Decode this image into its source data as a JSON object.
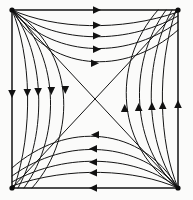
{
  "figure": {
    "type": "vector-field-phase-portrait",
    "background_color": "#fbfbfa",
    "line_color": "#141414",
    "frame_color": "#242424",
    "width": 193,
    "height": 200
  },
  "chart_data": {
    "type": "diagram",
    "subtitle": "",
    "xlabel": "",
    "ylabel": "",
    "grid": false,
    "legend": null,
    "axis_ranges": {
      "x": [
        12,
        178
      ],
      "y": [
        10,
        188
      ]
    },
    "frame": {
      "x0": 12,
      "y0": 10,
      "x1": 178,
      "y1": 188
    },
    "critical_points": [
      {
        "name": "top-left-corner",
        "x": 12,
        "y": 10,
        "kind": "source"
      },
      {
        "name": "top-right-corner",
        "x": 178,
        "y": 10,
        "kind": "sink"
      },
      {
        "name": "bottom-left-corner",
        "x": 12,
        "y": 188,
        "kind": "sink"
      },
      {
        "name": "bottom-right-corner",
        "x": 178,
        "y": 188,
        "kind": "source"
      },
      {
        "name": "center",
        "x": 95,
        "y": 99,
        "kind": "saddle"
      }
    ],
    "separatrices": [
      {
        "name": "diagonal-tl-br",
        "from": [
          12,
          10
        ],
        "to": [
          178,
          188
        ],
        "direction": "outward-from-center"
      },
      {
        "name": "diagonal-bl-tr",
        "from": [
          12,
          188
        ],
        "to": [
          178,
          10
        ],
        "direction": "inward-to-corners"
      }
    ],
    "trajectory_groups": [
      {
        "name": "top-band",
        "from": "top-left-source",
        "to": "top-right-sink",
        "count": 5,
        "arrow_direction": "right"
      },
      {
        "name": "left-band",
        "from": "top-left-source",
        "to": "bottom-left-sink",
        "count": 5,
        "arrow_direction": "down"
      },
      {
        "name": "bottom-band",
        "from": "bottom-right-source",
        "to": "bottom-left-sink",
        "count": 5,
        "arrow_direction": "left"
      },
      {
        "name": "right-band",
        "from": "bottom-right-source",
        "to": "top-right-sink",
        "count": 5,
        "arrow_direction": "up"
      }
    ],
    "arrow_count_total": 22
  }
}
